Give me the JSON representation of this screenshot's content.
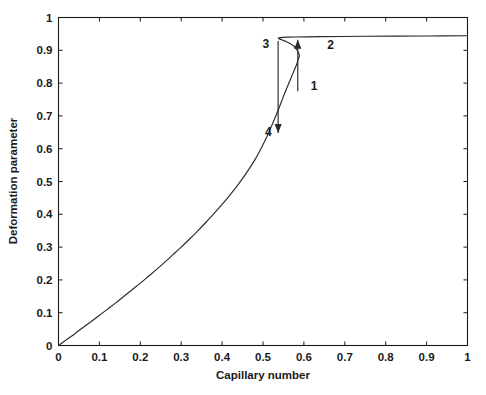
{
  "chart_data": {
    "type": "line",
    "title": "",
    "xlabel": "Capillary number",
    "ylabel": "Deformation parameter",
    "xlim": [
      0,
      1
    ],
    "ylim": [
      0,
      1
    ],
    "grid": false,
    "legend": null,
    "xticks": [
      "0",
      "0.1",
      "0.2",
      "0.3",
      "0.4",
      "0.5",
      "0.6",
      "0.7",
      "0.8",
      "0.9",
      "1"
    ],
    "xtick_values": [
      0,
      0.1,
      0.2,
      0.3,
      0.4,
      0.5,
      0.6,
      0.7,
      0.8,
      0.9,
      1
    ],
    "yticks": [
      "0",
      "0.1",
      "0.2",
      "0.3",
      "0.4",
      "0.5",
      "0.6",
      "0.7",
      "0.8",
      "0.9",
      "1"
    ],
    "ytick_values": [
      0,
      0.1,
      0.2,
      0.3,
      0.4,
      0.5,
      0.6,
      0.7,
      0.8,
      0.9,
      1
    ],
    "series": [
      {
        "name": "equilibrium-branch",
        "description": "S-shaped hysteresis curve: lower stable branch from origin rising to fold, unstable middle branch turning back, upper stable branch plateau",
        "x": [
          0.0,
          0.02,
          0.04,
          0.06,
          0.08,
          0.1,
          0.12,
          0.14,
          0.16,
          0.18,
          0.2,
          0.22,
          0.24,
          0.26,
          0.28,
          0.3,
          0.32,
          0.34,
          0.36,
          0.38,
          0.4,
          0.42,
          0.44,
          0.46,
          0.48,
          0.495,
          0.51,
          0.522,
          0.534,
          0.545,
          0.556,
          0.566,
          0.575,
          0.582,
          0.586,
          0.589,
          0.5835,
          0.575,
          0.566,
          0.556,
          0.546,
          0.54,
          0.5372,
          0.54,
          0.548,
          0.562,
          0.58,
          0.605,
          0.64,
          0.69,
          0.75,
          0.82,
          0.9,
          1.0
        ],
        "y": [
          0.0,
          0.018,
          0.036,
          0.055,
          0.073,
          0.092,
          0.111,
          0.13,
          0.15,
          0.17,
          0.19,
          0.211,
          0.232,
          0.254,
          0.277,
          0.3,
          0.324,
          0.349,
          0.375,
          0.402,
          0.43,
          0.46,
          0.492,
          0.527,
          0.566,
          0.6,
          0.638,
          0.672,
          0.708,
          0.743,
          0.778,
          0.808,
          0.835,
          0.856,
          0.872,
          0.885,
          0.9,
          0.913,
          0.921,
          0.927,
          0.932,
          0.9348,
          0.937,
          0.9382,
          0.9392,
          0.94,
          0.9405,
          0.941,
          0.9416,
          0.9422,
          0.9428,
          0.9433,
          0.9437,
          0.9442
        ]
      }
    ],
    "annotations": [
      {
        "label": "1",
        "x": 0.625,
        "y": 0.79,
        "role": "branch-label-lower-fold"
      },
      {
        "label": "2",
        "x": 0.665,
        "y": 0.915,
        "role": "branch-label-upper"
      },
      {
        "label": "3",
        "x": 0.507,
        "y": 0.918,
        "role": "branch-label-upper-left"
      },
      {
        "label": "4",
        "x": 0.513,
        "y": 0.65,
        "role": "branch-label-lower-left"
      }
    ],
    "arrows": [
      {
        "name": "jump-up-arrow",
        "x": 0.585,
        "y_start": 0.775,
        "y_end": 0.932,
        "direction": "up"
      },
      {
        "name": "jump-down-arrow",
        "x": 0.537,
        "y_start": 0.928,
        "y_end": 0.648,
        "direction": "down"
      }
    ],
    "colors": {
      "curve": "#2a2a2a",
      "axis": "#1a1a1a",
      "background": "#ffffff"
    }
  }
}
